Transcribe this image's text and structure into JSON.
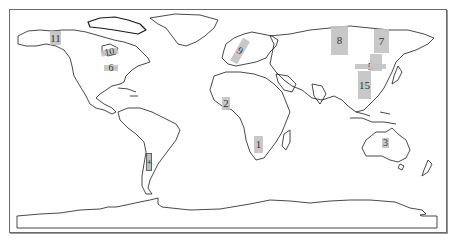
{
  "figure": {
    "type": "world-map",
    "colors": {
      "region_fill": "#c4c4c4",
      "coastline": "#1a1a1a",
      "frame": "#6a6a6a",
      "background": "#ffffff"
    }
  },
  "regions": [
    {
      "id": "1",
      "label": "1",
      "location": "Southern Africa"
    },
    {
      "id": "2",
      "label": "2",
      "location": "West Africa"
    },
    {
      "id": "3",
      "label": "3",
      "location": "Northern Australia"
    },
    {
      "id": "4",
      "label": "4",
      "location": "Southern Andes / Chile"
    },
    {
      "id": "5",
      "label": "5",
      "location": "Northeast China / Mongolia"
    },
    {
      "id": "6",
      "label": "6",
      "location": "Central North America"
    },
    {
      "id": "7",
      "label": "7",
      "location": "Eastern Siberia"
    },
    {
      "id": "8",
      "label": "8",
      "location": "Central Siberia"
    },
    {
      "id": "9",
      "label": "9",
      "location": "Scandinavia / Europe"
    },
    {
      "id": "10",
      "label": "10",
      "location": "Central Canada"
    },
    {
      "id": "11",
      "label": "11",
      "location": "Alaska"
    },
    {
      "id": "15",
      "label": "15",
      "location": "Eastern China"
    }
  ]
}
